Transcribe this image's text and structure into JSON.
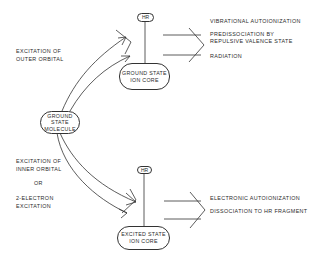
{
  "header": {
    "faint_title": ""
  },
  "nodes": {
    "ground_state_molecule": {
      "lines": [
        "GROUND",
        "STATE",
        "MOLECULE"
      ]
    },
    "ground_state_ion_core": {
      "lines": [
        "GROUND STATE",
        "ION CORE"
      ]
    },
    "excited_state_ion_core": {
      "lines": [
        "EXCITED STATE",
        "ION CORE"
      ]
    },
    "hr_top": {
      "label": "HR"
    },
    "hr_bottom": {
      "label": "HR"
    }
  },
  "left_labels": {
    "outer": [
      "EXCITATION OF",
      "OUTER ORBITAL"
    ],
    "inner": [
      "EXCITATION OF",
      "INNER ORBITAL"
    ],
    "or": "OR",
    "two_electron": [
      "2-ELECTRON",
      "EXCITATION"
    ]
  },
  "outcomes_upper": [
    {
      "lines": [
        "VIBRATIONAL AUTOIONIZATION"
      ]
    },
    {
      "lines": [
        "PREDISSOCIATION BY",
        "REPULSIVE VALENCE STATE"
      ]
    },
    {
      "lines": [
        "RADIATION"
      ]
    }
  ],
  "outcomes_lower": [
    {
      "lines": [
        "ELECTRONIC AUTOIONIZATION"
      ]
    },
    {
      "lines": [
        "DISSOCIATION TO HR FRAGMENT"
      ]
    }
  ],
  "colors": {
    "line": "#333333",
    "text": "#2b2b2b",
    "background": "#ffffff"
  }
}
